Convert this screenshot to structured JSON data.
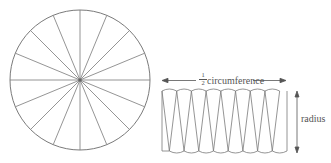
{
  "diagram": {
    "type": "circle-area-dissection",
    "circle": {
      "sectors": 16,
      "center": [
        80,
        80
      ],
      "radius": 70
    },
    "rearranged": {
      "wedges_up": 8,
      "wedges_down": 8
    },
    "labels": {
      "fraction_numerator": "1",
      "fraction_denominator": "2",
      "circumference": "circumference",
      "radius": "radius"
    },
    "colors": {
      "stroke": "#7a7a7a",
      "text": "#555555"
    }
  }
}
